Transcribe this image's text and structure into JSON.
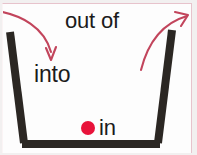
{
  "figure": {
    "background_color": "#fdfdfd",
    "outer_background_color": "#f2f0f0",
    "border_color": "#e7c3cc"
  },
  "labels": {
    "out_of": "out of",
    "into": "into",
    "in": "in"
  },
  "colors": {
    "text": "#1b1b1b",
    "arrow": "#c2455c",
    "container": "#2b2723",
    "dot": "#e8133a"
  },
  "shapes": {
    "container": {
      "name": "open-top-container",
      "left_wall": {
        "x1": 9,
        "y1": 31,
        "x2": 24,
        "y2": 142
      },
      "right_wall": {
        "x1": 171,
        "y1": 29,
        "x2": 156,
        "y2": 142
      },
      "bottom": {
        "x1": 24,
        "y1": 142,
        "x2": 156,
        "y2": 142
      },
      "stroke_width": 8
    },
    "dot": {
      "name": "red-object-dot",
      "cx": 87,
      "cy": 127,
      "r": 7
    }
  },
  "arrows": [
    {
      "name": "into-arrow",
      "label": "into",
      "direction": "down-into-container",
      "start": {
        "x": -2,
        "y": 11
      },
      "end": {
        "x": 50,
        "y": 57
      }
    },
    {
      "name": "out-of-arrow",
      "label": "out of",
      "direction": "up-out-of-container",
      "start": {
        "x": 142,
        "y": 67
      },
      "end": {
        "x": 187,
        "y": 14
      }
    }
  ]
}
